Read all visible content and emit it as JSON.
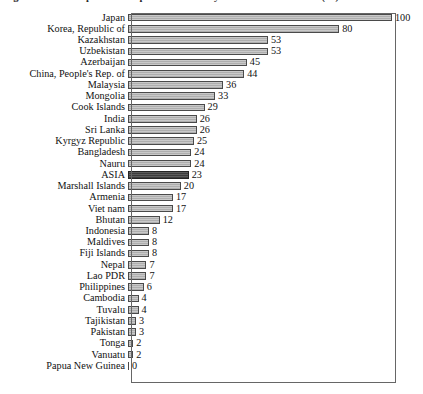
{
  "figure": {
    "title": "Figure 1.1.1 Per capita consumption of electricity in Asia and the Pacific (%)"
  },
  "chart_data": {
    "type": "bar",
    "orientation": "horizontal",
    "title": "Figure 1.1.1 Per capita consumption of electricity in Asia and the Pacific (%)",
    "xlabel": "",
    "ylabel": "",
    "xlim": [
      0,
      100
    ],
    "grid": false,
    "legend": null,
    "highlight_category": "ASIA",
    "highlight_color": "#4e4e4e",
    "bar_color": "#b8b8b8",
    "bar_border_color": "#4a4a4a",
    "categories": [
      "Japan",
      "Korea, Republic of",
      "Kazakhstan",
      "Uzbekistan",
      "Azerbaijan",
      "China, People's Rep. of",
      "Malaysia",
      "Mongolia",
      "Cook Islands",
      "India",
      "Sri Lanka",
      "Kyrgyz Republic",
      "Bangladesh",
      "Nauru",
      "ASIA",
      "Marshall Islands",
      "Armenia",
      "Viet nam",
      "Bhutan",
      "Indonesia",
      "Maldives",
      "Fiji Islands",
      "Nepal",
      "Lao PDR",
      "Philippines",
      "Cambodia",
      "Tuvalu",
      "Tajikistan",
      "Pakistan",
      "Tonga",
      "Vanuatu",
      "Papua New Guinea"
    ],
    "values": [
      100,
      80,
      53,
      53,
      45,
      44,
      36,
      33,
      29,
      26,
      26,
      25,
      24,
      24,
      23,
      20,
      17,
      17,
      12,
      8,
      8,
      8,
      7,
      7,
      6,
      4,
      4,
      3,
      3,
      2,
      2,
      0
    ]
  }
}
